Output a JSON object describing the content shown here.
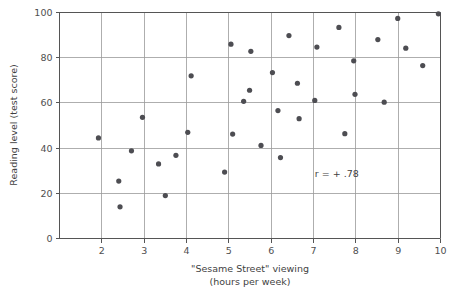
{
  "chart_data": {
    "type": "scatter",
    "title": "",
    "xlabel": "\"Sesame Street\" viewing",
    "xlabel_line2": "(hours per week)",
    "ylabel": "Reading level (test score)",
    "xlim": [
      1.0,
      10.0
    ],
    "ylim": [
      0,
      100
    ],
    "xticks": [
      2,
      3,
      4,
      5,
      6,
      7,
      8,
      9,
      10
    ],
    "yticks": [
      0,
      20,
      40,
      60,
      80,
      100
    ],
    "xtick_labels": [
      "2",
      "3",
      "4",
      "5",
      "6",
      "7",
      "8",
      "9",
      "10"
    ],
    "ytick_labels": [
      "0",
      "20",
      "40",
      "60",
      "80",
      "100"
    ],
    "grid": true,
    "grid_axis": "y",
    "legend": null,
    "annotations": [
      {
        "name": "correlation-annotation",
        "text": "r = + .78",
        "x": 7.55,
        "y": 27
      }
    ],
    "marker": {
      "shape": "circle",
      "size": 2.6,
      "color": "#4d4d52"
    },
    "points": [
      {
        "x": 1.92,
        "y": 44.5
      },
      {
        "x": 2.4,
        "y": 25.4
      },
      {
        "x": 2.43,
        "y": 14.0
      },
      {
        "x": 2.7,
        "y": 38.8
      },
      {
        "x": 2.96,
        "y": 53.6
      },
      {
        "x": 3.34,
        "y": 33.0
      },
      {
        "x": 3.5,
        "y": 19.0
      },
      {
        "x": 3.75,
        "y": 36.8
      },
      {
        "x": 4.03,
        "y": 47.0
      },
      {
        "x": 4.11,
        "y": 72.0
      },
      {
        "x": 4.9,
        "y": 29.4
      },
      {
        "x": 5.05,
        "y": 86.0
      },
      {
        "x": 5.09,
        "y": 46.2
      },
      {
        "x": 5.35,
        "y": 60.7
      },
      {
        "x": 5.49,
        "y": 65.6
      },
      {
        "x": 5.52,
        "y": 82.8
      },
      {
        "x": 5.76,
        "y": 41.2
      },
      {
        "x": 6.03,
        "y": 73.4
      },
      {
        "x": 6.16,
        "y": 56.6
      },
      {
        "x": 6.22,
        "y": 35.8
      },
      {
        "x": 6.42,
        "y": 89.8
      },
      {
        "x": 6.62,
        "y": 68.7
      },
      {
        "x": 6.66,
        "y": 53.0
      },
      {
        "x": 7.03,
        "y": 61.1
      },
      {
        "x": 7.08,
        "y": 84.7
      },
      {
        "x": 7.6,
        "y": 93.4
      },
      {
        "x": 7.74,
        "y": 46.4
      },
      {
        "x": 7.95,
        "y": 78.6
      },
      {
        "x": 7.98,
        "y": 63.8
      },
      {
        "x": 8.52,
        "y": 88.0
      },
      {
        "x": 8.67,
        "y": 60.3
      },
      {
        "x": 8.99,
        "y": 97.4
      },
      {
        "x": 9.18,
        "y": 84.2
      },
      {
        "x": 9.58,
        "y": 76.5
      },
      {
        "x": 9.95,
        "y": 99.4
      }
    ]
  }
}
